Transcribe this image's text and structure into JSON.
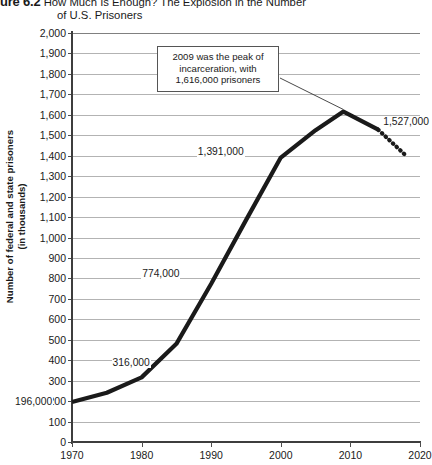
{
  "header": {
    "figure_number": "ure 6.2",
    "title_line1": "How Much Is Enough? The Explosion in the Number",
    "title_line2": "of U.S. Prisoners"
  },
  "chart_data": {
    "type": "line",
    "title": "How Much Is Enough? The Explosion in the Number of U.S. Prisoners",
    "xlabel": "",
    "ylabel": "Number of federal and state prisoners\n(in thousands)",
    "xlim": [
      1970,
      2020
    ],
    "ylim": [
      0,
      2000
    ],
    "grid": true,
    "legend_position": "none",
    "xticks": [
      "1970",
      "1980",
      "1990",
      "2000",
      "2010",
      "2020"
    ],
    "xtick_values": [
      1970,
      1980,
      1990,
      2000,
      2010,
      2020
    ],
    "yticks": [
      "0",
      "100",
      "200",
      "300",
      "400",
      "500",
      "600",
      "700",
      "800",
      "900",
      "1,000",
      "1,100",
      "1,200",
      "1,300",
      "1,400",
      "1,500",
      "1,600",
      "1,700",
      "1,800",
      "1,900",
      "2,000"
    ],
    "ytick_values": [
      0,
      100,
      200,
      300,
      400,
      500,
      600,
      700,
      800,
      900,
      1000,
      1100,
      1200,
      1300,
      1400,
      1500,
      1600,
      1700,
      1800,
      1900,
      2000
    ],
    "series": [
      {
        "name": "Federal and state prisoners (actual)",
        "style": "solid",
        "color": "#1a1a1a",
        "x": [
          1970,
          1975,
          1980,
          1985,
          1990,
          1995,
          2000,
          2005,
          2009,
          2014
        ],
        "values": [
          196,
          241,
          316,
          480,
          774,
          1085,
          1391,
          1525,
          1616,
          1527
        ]
      },
      {
        "name": "Projected decline",
        "style": "dotted",
        "color": "#1a1a1a",
        "x": [
          2014,
          2018
        ],
        "values": [
          1527,
          1400
        ]
      }
    ],
    "point_labels": [
      {
        "text": "196,000",
        "x": 1970,
        "value": 196
      },
      {
        "text": "316,000",
        "x": 1980,
        "value": 316
      },
      {
        "text": "774,000",
        "x": 1990,
        "value": 774
      },
      {
        "text": "1,391,000",
        "x": 2000,
        "value": 1391
      },
      {
        "text": "1,527,000",
        "x": 2014,
        "value": 1527
      }
    ],
    "annotations": [
      {
        "text": "2009 was the peak of\nincarceration, with\n1,616,000 prisoners",
        "points_to_x": 2009,
        "points_to_value": 1616
      }
    ]
  }
}
